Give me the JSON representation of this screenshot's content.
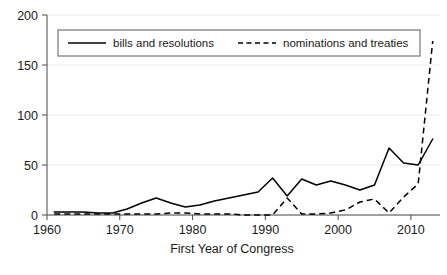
{
  "chart_data": {
    "type": "line",
    "title": "",
    "subtitle": "",
    "xlabel": "First Year of Congress",
    "ylabel": "",
    "xlim": [
      1960,
      2014
    ],
    "ylim": [
      0,
      200
    ],
    "grid": true,
    "legend_position": "top-inside",
    "x_ticks": [
      "1960",
      "1970",
      "1980",
      "1990",
      "2000",
      "2010"
    ],
    "x_tick_values": [
      1960,
      1970,
      1980,
      1990,
      2000,
      2010
    ],
    "y_ticks": [
      "0",
      "50",
      "100",
      "150",
      "200"
    ],
    "y_tick_values": [
      0,
      50,
      100,
      150,
      200
    ],
    "x": [
      1961,
      1963,
      1965,
      1967,
      1969,
      1971,
      1973,
      1975,
      1977,
      1979,
      1981,
      1983,
      1985,
      1987,
      1989,
      1991,
      1993,
      1995,
      1997,
      1999,
      2001,
      2003,
      2005,
      2007,
      2009,
      2011,
      2013
    ],
    "series": [
      {
        "name": "bills and resolutions",
        "style": "solid",
        "color": "#000000",
        "values": [
          3,
          3,
          3,
          2,
          2,
          6,
          12,
          17,
          12,
          8,
          10,
          14,
          17,
          20,
          23,
          37,
          19,
          36,
          30,
          34,
          30,
          25,
          30,
          67,
          52,
          50,
          76
        ]
      },
      {
        "name": "nominations and treaties",
        "style": "dashed",
        "color": "#000000",
        "values": [
          1,
          1,
          1,
          1,
          1,
          1,
          1,
          1,
          2,
          2,
          1,
          1,
          1,
          0,
          0,
          0,
          17,
          1,
          1,
          2,
          5,
          13,
          16,
          2,
          18,
          31,
          174
        ]
      }
    ]
  },
  "legend": {
    "items": [
      {
        "label": "bills and resolutions",
        "style": "solid"
      },
      {
        "label": "nominations and treaties",
        "style": "dashed"
      }
    ]
  },
  "axes": {
    "x_label": "First Year of Congress"
  }
}
